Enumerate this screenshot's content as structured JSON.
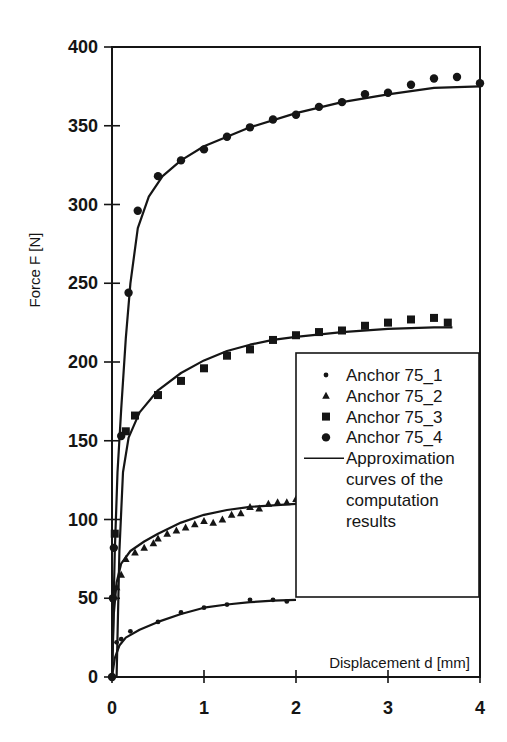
{
  "chart_data": {
    "type": "scatter",
    "title": "",
    "xlabel": "Displacement d [mm]",
    "ylabel": "Force  F [N]",
    "xlim": [
      0,
      4
    ],
    "ylim": [
      0,
      400
    ],
    "xticks": [
      0,
      1,
      2,
      3,
      4
    ],
    "yticks": [
      0,
      50,
      100,
      150,
      200,
      250,
      300,
      350,
      400
    ],
    "grid": false,
    "legend_position": "lower right (inside plot)",
    "series": [
      {
        "name": "Anchor 75_1",
        "marker": "small-dot",
        "x": [
          0.0,
          0.05,
          0.1,
          0.2,
          0.5,
          0.75,
          1.0,
          1.25,
          1.5,
          1.75,
          1.9
        ],
        "y": [
          0,
          22,
          24,
          29,
          35,
          41,
          44,
          46,
          49,
          49,
          48
        ]
      },
      {
        "name": "Anchor 75_2",
        "marker": "triangle",
        "x": [
          0.05,
          0.1,
          0.15,
          0.25,
          0.35,
          0.45,
          0.5,
          0.6,
          0.7,
          0.8,
          0.9,
          1.0,
          1.1,
          1.2,
          1.3,
          1.4,
          1.5,
          1.6,
          1.7,
          1.8,
          1.9,
          2.0
        ],
        "y": [
          57,
          65,
          75,
          79,
          82,
          85,
          88,
          91,
          93,
          95,
          97,
          99,
          98,
          100,
          103,
          104,
          108,
          107,
          110,
          111,
          111,
          113
        ]
      },
      {
        "name": "Anchor 75_3",
        "marker": "square",
        "x": [
          0.03,
          0.15,
          0.25,
          0.5,
          0.75,
          1.0,
          1.25,
          1.5,
          1.75,
          2.0,
          2.25,
          2.5,
          2.75,
          3.0,
          3.25,
          3.5,
          3.65
        ],
        "y": [
          91,
          156,
          166,
          179,
          188,
          196,
          204,
          208,
          214,
          217,
          219,
          220,
          223,
          225,
          227,
          228,
          225
        ]
      },
      {
        "name": "Anchor 75_4",
        "marker": "circle",
        "x": [
          0.0,
          0.01,
          0.02,
          0.1,
          0.18,
          0.28,
          0.5,
          0.75,
          1.0,
          1.25,
          1.5,
          1.75,
          2.0,
          2.25,
          2.5,
          2.75,
          3.0,
          3.25,
          3.5,
          3.75,
          4.0
        ],
        "y": [
          0,
          50,
          82,
          153,
          244,
          296,
          318,
          328,
          335,
          343,
          349,
          354,
          357,
          362,
          365,
          370,
          371,
          376,
          380,
          381,
          377
        ]
      }
    ],
    "approximation_curves": {
      "name": "Approximation curves of the computation results",
      "curves": [
        {
          "for": "Anchor 75_1",
          "x": [
            0.0,
            0.03,
            0.08,
            0.15,
            0.3,
            0.5,
            0.75,
            1.0,
            1.25,
            1.5,
            1.75,
            2.0
          ],
          "y": [
            0,
            12,
            20,
            25,
            30,
            35,
            40,
            44,
            46,
            47.5,
            48.5,
            49
          ]
        },
        {
          "for": "Anchor 75_2",
          "x": [
            0.0,
            0.02,
            0.05,
            0.1,
            0.2,
            0.35,
            0.5,
            0.75,
            1.0,
            1.25,
            1.5,
            1.75,
            2.0
          ],
          "y": [
            0,
            40,
            60,
            72,
            80,
            86,
            91,
            98,
            103,
            106,
            108,
            109,
            110
          ]
        },
        {
          "for": "Anchor 75_3",
          "x": [
            0.05,
            0.08,
            0.12,
            0.18,
            0.3,
            0.5,
            0.75,
            1.0,
            1.25,
            1.5,
            1.75,
            2.0,
            2.5,
            3.0,
            3.5,
            3.7
          ],
          "y": [
            0,
            80,
            130,
            152,
            168,
            182,
            193,
            201,
            207,
            211,
            214,
            216,
            219,
            221,
            222,
            222
          ]
        },
        {
          "for": "Anchor 75_4",
          "x": [
            0.0,
            0.03,
            0.06,
            0.1,
            0.15,
            0.2,
            0.28,
            0.4,
            0.55,
            0.75,
            1.0,
            1.5,
            2.0,
            2.5,
            3.0,
            3.5,
            4.0
          ],
          "y": [
            0,
            80,
            130,
            170,
            215,
            250,
            285,
            305,
            318,
            328,
            337,
            349,
            358,
            365,
            370,
            374,
            375
          ]
        }
      ]
    },
    "legend": {
      "entries": [
        {
          "label": "Anchor 75_1",
          "marker": "small-dot"
        },
        {
          "label": "Anchor 75_2",
          "marker": "triangle"
        },
        {
          "label": "Anchor 75_3",
          "marker": "square"
        },
        {
          "label": "Anchor 75_4",
          "marker": "circle"
        },
        {
          "label_lines": [
            "Approximation",
            "curves of the",
            "computation",
            "results"
          ],
          "marker": "line"
        }
      ]
    }
  },
  "colors": {
    "ink": "#151515",
    "background": "#ffffff"
  }
}
